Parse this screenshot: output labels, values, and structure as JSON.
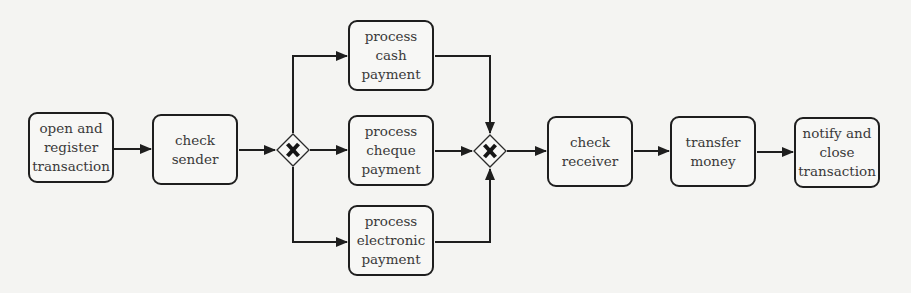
{
  "diagram": {
    "type": "bpmn-process",
    "colors": {
      "stroke": "#1e1e1e",
      "text": "#3a3a3a",
      "background": "#f4f4f2"
    },
    "tasks": [
      {
        "id": "t1",
        "label": "open and\nregister\ntransaction",
        "x": 28,
        "y": 112
      },
      {
        "id": "t2",
        "label": "check\nsender",
        "x": 152,
        "y": 114
      },
      {
        "id": "t3",
        "label": "process\ncash\npayment",
        "x": 348,
        "y": 20
      },
      {
        "id": "t4",
        "label": "process\ncheque\npayment",
        "x": 348,
        "y": 115
      },
      {
        "id": "t5",
        "label": "process\nelectronic\npayment",
        "x": 348,
        "y": 205
      },
      {
        "id": "t6",
        "label": "check\nreceiver",
        "x": 547,
        "y": 116
      },
      {
        "id": "t7",
        "label": "transfer\nmoney",
        "x": 670,
        "y": 116
      },
      {
        "id": "t8",
        "label": "notify and\nclose\ntransaction",
        "x": 794,
        "y": 117
      }
    ],
    "gateways": [
      {
        "id": "g1",
        "kind": "exclusive-split",
        "marker": "X",
        "cx": 293,
        "cy": 150
      },
      {
        "id": "g2",
        "kind": "exclusive-join",
        "marker": "X",
        "cx": 490,
        "cy": 151
      }
    ],
    "flows": [
      [
        "t1",
        "t2"
      ],
      [
        "t2",
        "g1"
      ],
      [
        "g1",
        "t3"
      ],
      [
        "g1",
        "t4"
      ],
      [
        "g1",
        "t5"
      ],
      [
        "t3",
        "g2"
      ],
      [
        "t4",
        "g2"
      ],
      [
        "t5",
        "g2"
      ],
      [
        "g2",
        "t6"
      ],
      [
        "t6",
        "t7"
      ],
      [
        "t7",
        "t8"
      ]
    ]
  }
}
